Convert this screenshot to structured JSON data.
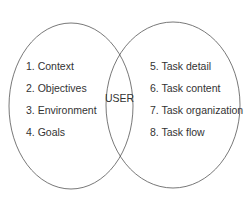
{
  "diagram": {
    "type": "venn",
    "center_label": "USER",
    "left_items": [
      "1. Context",
      "2. Objectives",
      "3. Environment",
      "4. Goals"
    ],
    "right_items": [
      "5. Task detail",
      "6. Task content",
      "7. Task organization",
      "8. Task flow"
    ],
    "stroke_color": "#555555"
  }
}
